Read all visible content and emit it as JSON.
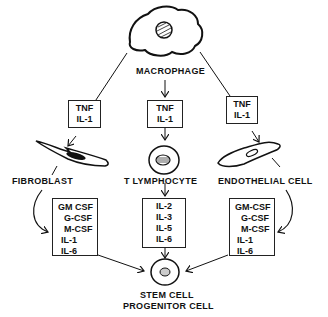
{
  "diagram": {
    "nodes": {
      "macrophage": {
        "label": "MACROPHAGE"
      },
      "fibroblast": {
        "label": "FIBROBLAST"
      },
      "t_lymphocyte": {
        "label": "T LYMPHOCYTE"
      },
      "endothelial": {
        "label": "ENDOTHELIAL CELL"
      },
      "stem_cell": {
        "line1": "STEM CELL",
        "line2": "PROGENITOR CELL"
      }
    },
    "boxes": {
      "tnf_left": {
        "lines": [
          "TNF",
          "IL-1"
        ]
      },
      "tnf_center": {
        "lines": [
          "TNF",
          "IL-1"
        ]
      },
      "tnf_right": {
        "lines": [
          "TNF",
          "IL-1"
        ]
      },
      "fibroblast_products": {
        "lines": [
          "GM CSF",
          "G-CSF",
          "M-CSF",
          "IL-1",
          "IL-6"
        ]
      },
      "tcell_products": {
        "lines": [
          "IL-2",
          "IL-3",
          "IL-5",
          "IL-6"
        ]
      },
      "endothelial_products": {
        "lines": [
          "GM-CSF",
          "G-CSF",
          "M-CSF",
          "IL-1",
          "IL-6"
        ]
      }
    },
    "edges": [
      {
        "from": "macrophage",
        "to": "tnf_left"
      },
      {
        "from": "macrophage",
        "to": "tnf_center"
      },
      {
        "from": "macrophage",
        "to": "tnf_right"
      },
      {
        "from": "tnf_left",
        "to": "fibroblast"
      },
      {
        "from": "tnf_center",
        "to": "t_lymphocyte"
      },
      {
        "from": "tnf_right",
        "to": "endothelial"
      },
      {
        "from": "fibroblast",
        "to": "fibroblast_products"
      },
      {
        "from": "t_lymphocyte",
        "to": "tcell_products"
      },
      {
        "from": "endothelial",
        "to": "endothelial_products"
      },
      {
        "from": "fibroblast_products",
        "to": "stem_cell"
      },
      {
        "from": "tcell_products",
        "to": "stem_cell"
      },
      {
        "from": "endothelial_products",
        "to": "stem_cell"
      }
    ]
  }
}
